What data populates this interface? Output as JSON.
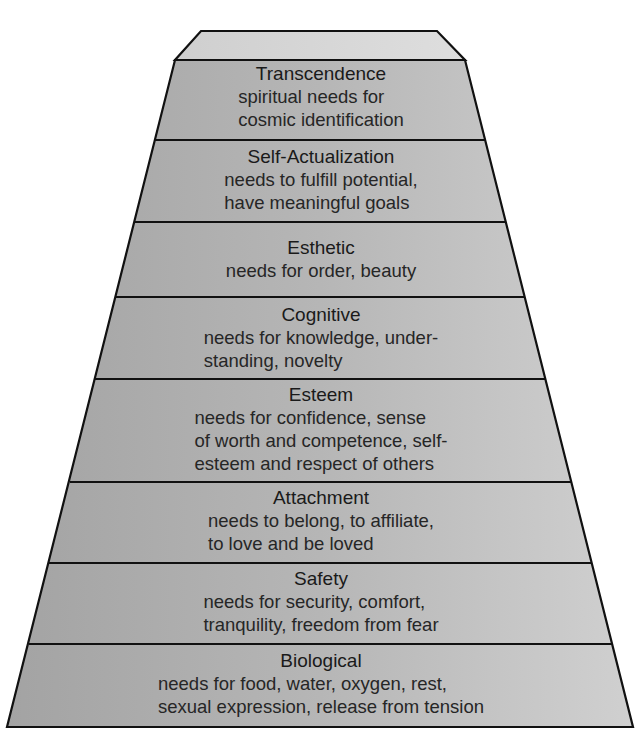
{
  "figure": {
    "top_cropped_caption": "Figure — Maslow's hierarchy (caption cropped)",
    "colors": {
      "outline": "#111111",
      "cap_fill": "#d6d6d6",
      "body_fill_left": "#a6a6a6",
      "body_fill_right": "#cfcfcf",
      "text": "#222222"
    },
    "tiers": [
      {
        "title": "Transcendence",
        "lines": [
          "spiritual needs for",
          "cosmic identification"
        ]
      },
      {
        "title": "Self-Actualization",
        "lines": [
          "needs to fulfill potential,",
          "have meaningful goals"
        ]
      },
      {
        "title": "Esthetic",
        "lines": [
          "needs for order, beauty"
        ]
      },
      {
        "title": "Cognitive",
        "lines": [
          "needs for knowledge, under-",
          "standing, novelty"
        ]
      },
      {
        "title": "Esteem",
        "lines": [
          "needs for confidence, sense",
          "of worth and competence, self-",
          "esteem and respect of others"
        ]
      },
      {
        "title": "Attachment",
        "lines": [
          "needs to belong, to affiliate,",
          "to love and be loved"
        ]
      },
      {
        "title": "Safety",
        "lines": [
          "needs for security, comfort,",
          "tranquility, freedom from fear"
        ]
      },
      {
        "title": "Biological",
        "lines": [
          "needs for food, water, oxygen, rest,",
          "sexual expression, release from tension"
        ]
      }
    ]
  }
}
